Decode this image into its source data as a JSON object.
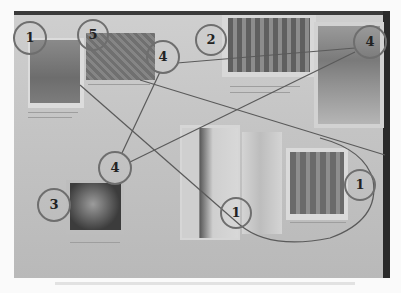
{
  "scene": {
    "description": "Photograph of a poster board with pasted photos, connected by drawn lines and numbered circles",
    "colors": {
      "board": "#c6c6c6",
      "border": "#2f2f2f",
      "circle_stroke": "#6e6e6e",
      "line": "#5a5a5a"
    }
  },
  "markers": [
    {
      "id": "m1",
      "label": "1",
      "cx": 30,
      "cy": 38,
      "r": 16
    },
    {
      "id": "m2",
      "label": "5",
      "cx": 93,
      "cy": 35,
      "r": 15
    },
    {
      "id": "m3",
      "label": "4",
      "cx": 163,
      "cy": 57,
      "r": 16
    },
    {
      "id": "m4",
      "label": "2",
      "cx": 211,
      "cy": 40,
      "r": 15
    },
    {
      "id": "m5",
      "label": "4",
      "cx": 370,
      "cy": 42,
      "r": 16
    },
    {
      "id": "m6",
      "label": "4",
      "cx": 115,
      "cy": 168,
      "r": 16
    },
    {
      "id": "m7",
      "label": "3",
      "cx": 54,
      "cy": 205,
      "r": 16
    },
    {
      "id": "m8",
      "label": "1",
      "cx": 236,
      "cy": 213,
      "r": 15
    },
    {
      "id": "m9",
      "label": "1",
      "cx": 360,
      "cy": 185,
      "r": 15
    }
  ],
  "photos": [
    {
      "name": "photo-top-left",
      "x": 30,
      "y": 40,
      "w": 50,
      "h": 63
    },
    {
      "name": "photo-crowd",
      "x": 86,
      "y": 33,
      "w": 69,
      "h": 47
    },
    {
      "name": "photo-group",
      "x": 228,
      "y": 18,
      "w": 82,
      "h": 54
    },
    {
      "name": "photo-poster",
      "x": 318,
      "y": 26,
      "w": 62,
      "h": 98
    },
    {
      "name": "photo-dark",
      "x": 70,
      "y": 183,
      "w": 51,
      "h": 47
    },
    {
      "name": "photo-person-left",
      "x": 182,
      "y": 128,
      "w": 56,
      "h": 110
    },
    {
      "name": "photo-person-right",
      "x": 242,
      "y": 132,
      "w": 40,
      "h": 102
    },
    {
      "name": "photo-figures",
      "x": 290,
      "y": 152,
      "w": 54,
      "h": 62
    }
  ]
}
